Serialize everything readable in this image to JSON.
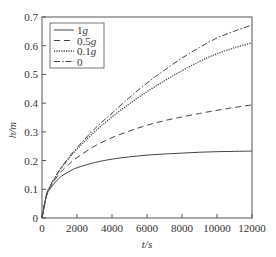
{
  "chart_data": {
    "type": "line",
    "title": "",
    "xlabel": "t/s",
    "ylabel": "h/m",
    "xlim": [
      0,
      12000
    ],
    "ylim": [
      0,
      0.7
    ],
    "xticks": [
      0,
      2000,
      4000,
      6000,
      8000,
      10000,
      12000
    ],
    "yticks": [
      0,
      0.1,
      0.2,
      0.3,
      0.4,
      0.5,
      0.6,
      0.7
    ],
    "xtick_labels": [
      "0",
      "2000",
      "4000",
      "6000",
      "8000",
      "10000",
      "12000"
    ],
    "ytick_labels": [
      "0",
      "0.1",
      "0.2",
      "0.3",
      "0.4",
      "0.5",
      "0.6",
      "0.7"
    ],
    "grid": false,
    "legend_position": "upper left",
    "x": [
      0,
      250,
      500,
      1000,
      1500,
      2000,
      3000,
      4000,
      5000,
      6000,
      7000,
      8000,
      9000,
      10000,
      11000,
      12000
    ],
    "series": [
      {
        "name": "1g",
        "style": "solid",
        "values": [
          0,
          0.075,
          0.105,
          0.14,
          0.16,
          0.175,
          0.193,
          0.205,
          0.213,
          0.219,
          0.223,
          0.226,
          0.229,
          0.231,
          0.232,
          0.233
        ]
      },
      {
        "name": "0.5g",
        "style": "dashed",
        "values": [
          0,
          0.078,
          0.11,
          0.155,
          0.185,
          0.21,
          0.25,
          0.28,
          0.303,
          0.323,
          0.339,
          0.352,
          0.364,
          0.375,
          0.385,
          0.394
        ]
      },
      {
        "name": "0.1g",
        "style": "dotted",
        "values": [
          0,
          0.08,
          0.115,
          0.165,
          0.205,
          0.24,
          0.3,
          0.352,
          0.398,
          0.44,
          0.478,
          0.513,
          0.545,
          0.572,
          0.593,
          0.61
        ]
      },
      {
        "name": "0",
        "style": "dashdot",
        "values": [
          0,
          0.08,
          0.116,
          0.167,
          0.208,
          0.245,
          0.31,
          0.365,
          0.42,
          0.47,
          0.515,
          0.557,
          0.594,
          0.627,
          0.651,
          0.672
        ]
      }
    ]
  }
}
